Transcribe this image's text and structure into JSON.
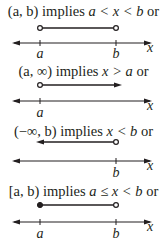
{
  "diagram": {
    "panels": [
      {
        "id": "open-interval",
        "notation": "(a, b)",
        "verb": "implies",
        "inequality": "a < x < b",
        "suffix": "or",
        "axis_variable": "x",
        "ticks": [
          "a",
          "b"
        ],
        "left_endpoint": "open",
        "right_endpoint": "open"
      },
      {
        "id": "right-unbounded",
        "notation": "(a, ∞)",
        "verb": "implies",
        "inequality": "x > a",
        "suffix": "or",
        "axis_variable": "x",
        "ticks": [
          "a"
        ],
        "left_endpoint": "open",
        "right_endpoint": "arrow"
      },
      {
        "id": "left-unbounded",
        "notation": "(−∞, b)",
        "verb": "implies",
        "inequality": "x < b",
        "suffix": "or",
        "axis_variable": "x",
        "ticks": [
          "b"
        ],
        "left_endpoint": "arrow",
        "right_endpoint": "open"
      },
      {
        "id": "half-open-interval",
        "notation": "[a, b)",
        "verb": "implies",
        "inequality": "a ≤ x < b",
        "suffix": "or",
        "axis_variable": "x",
        "ticks": [
          "a",
          "b"
        ],
        "left_endpoint": "closed",
        "right_endpoint": "open"
      }
    ],
    "colors": {
      "ink": "#231f20",
      "background": "#ffffff"
    }
  }
}
